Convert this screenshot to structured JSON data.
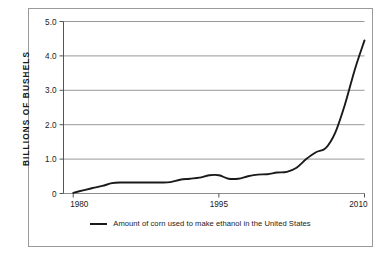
{
  "figure": {
    "frame_color": "#9a9a9a",
    "background": "#ffffff",
    "line_color": "#1a1a1a",
    "grid_color": "#8c8c8c"
  },
  "y_axis_title": "BILLIONS OF BUSHELS",
  "legend": {
    "label": "Amount of corn used to make ethanol in the United States",
    "swatch_name": "legend-line-swatch"
  },
  "chart_data": {
    "type": "line",
    "title": "",
    "subtitle": "",
    "xlabel": "",
    "ylabel": "BILLIONS OF BUSHELS",
    "xlim": [
      1979,
      2010
    ],
    "ylim": [
      0,
      5.0
    ],
    "grid": true,
    "grid_axis": "y",
    "legend_position": "bottom",
    "xticks": [
      1980,
      1995,
      2010
    ],
    "xticklabels": [
      "1980",
      "1995",
      "2010"
    ],
    "yticks": [
      0,
      1.0,
      2.0,
      3.0,
      4.0,
      5.0
    ],
    "yticklabels": [
      "0",
      "1.0",
      "2.0",
      "3.0",
      "4.0",
      "5.0"
    ],
    "series": [
      {
        "name": "Amount of corn used to make ethanol in the United States",
        "color": "#1a1a1a",
        "x": [
          1980,
          1981,
          1982,
          1983,
          1984,
          1985,
          1986,
          1987,
          1988,
          1989,
          1990,
          1991,
          1992,
          1993,
          1994,
          1995,
          1996,
          1997,
          1998,
          1999,
          2000,
          2001,
          2002,
          2003,
          2004,
          2005,
          2006,
          2007,
          2008,
          2009,
          2010
        ],
        "y": [
          0.02,
          0.09,
          0.16,
          0.22,
          0.3,
          0.32,
          0.32,
          0.32,
          0.32,
          0.32,
          0.33,
          0.4,
          0.43,
          0.46,
          0.53,
          0.53,
          0.43,
          0.43,
          0.5,
          0.55,
          0.56,
          0.61,
          0.63,
          0.75,
          1.0,
          1.2,
          1.32,
          1.78,
          2.6,
          3.6,
          4.45
        ]
      }
    ]
  }
}
